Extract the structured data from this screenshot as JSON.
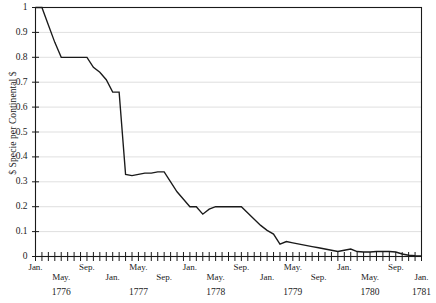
{
  "chart_data": {
    "type": "line",
    "title": "",
    "subtitle": "",
    "xlabel": "",
    "ylabel": "$ Specie per Continental $",
    "ylim": [
      0,
      1
    ],
    "xlim": [
      "Jan. 1776",
      "Jan. 1781"
    ],
    "grid": true,
    "legend": false,
    "series": [
      {
        "name": "$ Specie per Continental $",
        "color": "#1a1a1a",
        "x": [
          "Jan. 1776",
          "Feb. 1776",
          "Mar. 1776",
          "Apr. 1776",
          "May. 1776",
          "Jun. 1776",
          "Jul. 1776",
          "Aug. 1776",
          "Sep. 1776",
          "Oct. 1776",
          "Nov. 1776",
          "Dec. 1776",
          "Jan. 1777",
          "Feb. 1777",
          "Mar. 1777",
          "Apr. 1777",
          "May. 1777",
          "Jun. 1777",
          "Jul. 1777",
          "Aug. 1777",
          "Sep. 1777",
          "Oct. 1777",
          "Nov. 1777",
          "Dec. 1777",
          "Jan. 1778",
          "Feb. 1778",
          "Mar. 1778",
          "Apr. 1778",
          "May. 1778",
          "Jun. 1778",
          "Jul. 1778",
          "Aug. 1778",
          "Sep. 1778",
          "Oct. 1778",
          "Nov. 1778",
          "Dec. 1778",
          "Jan. 1779",
          "Feb. 1779",
          "Mar. 1779",
          "Apr. 1779",
          "May. 1779",
          "Jun. 1779",
          "Jul. 1779",
          "Aug. 1779",
          "Sep. 1779",
          "Oct. 1779",
          "Nov. 1779",
          "Dec. 1779",
          "Jan. 1780",
          "Feb. 1780",
          "Mar. 1780",
          "Apr. 1780",
          "May. 1780",
          "Jun. 1780",
          "Jul. 1780",
          "Aug. 1780",
          "Sep. 1780",
          "Oct. 1780",
          "Nov. 1780",
          "Dec. 1780",
          "Jan. 1781"
        ],
        "values": [
          1.0,
          1.0,
          0.93,
          0.86,
          0.8,
          0.8,
          0.8,
          0.8,
          0.8,
          0.76,
          0.74,
          0.71,
          0.66,
          0.66,
          0.33,
          0.325,
          0.33,
          0.335,
          0.335,
          0.34,
          0.34,
          0.3,
          0.26,
          0.23,
          0.2,
          0.2,
          0.17,
          0.19,
          0.2,
          0.2,
          0.2,
          0.2,
          0.2,
          0.175,
          0.15,
          0.125,
          0.105,
          0.09,
          0.05,
          0.06,
          0.055,
          0.05,
          0.045,
          0.04,
          0.035,
          0.03,
          0.025,
          0.02,
          0.025,
          0.03,
          0.02,
          0.018,
          0.018,
          0.02,
          0.02,
          0.02,
          0.018,
          0.01,
          0.005,
          0.003,
          0.002
        ]
      }
    ],
    "y_ticks": [
      "0",
      "0.1",
      "0.2",
      "0.3",
      "0.4",
      "0.5",
      "0.6",
      "0.7",
      "0.8",
      "0.9",
      "1"
    ],
    "y_tick_values": [
      0,
      0.1,
      0.2,
      0.3,
      0.4,
      0.5,
      0.6,
      0.7,
      0.8,
      0.9,
      1
    ],
    "x_tick_labels": [
      {
        "label": "Jan.",
        "month_index": 0,
        "row": 0
      },
      {
        "label": "May.",
        "month_index": 4,
        "row": 1
      },
      {
        "label": "Sep.",
        "month_index": 8,
        "row": 0
      },
      {
        "label": "Jan.",
        "month_index": 12,
        "row": 1
      },
      {
        "label": "May.",
        "month_index": 16,
        "row": 0
      },
      {
        "label": "Sep.",
        "month_index": 20,
        "row": 1
      },
      {
        "label": "Jan.",
        "month_index": 24,
        "row": 0
      },
      {
        "label": "May.",
        "month_index": 28,
        "row": 1
      },
      {
        "label": "Sep.",
        "month_index": 32,
        "row": 0
      },
      {
        "label": "Jan.",
        "month_index": 36,
        "row": 1
      },
      {
        "label": "May.",
        "month_index": 40,
        "row": 0
      },
      {
        "label": "Sep.",
        "month_index": 44,
        "row": 1
      },
      {
        "label": "Jan.",
        "month_index": 48,
        "row": 0
      },
      {
        "label": "May.",
        "month_index": 52,
        "row": 1
      },
      {
        "label": "Sep.",
        "month_index": 56,
        "row": 0
      },
      {
        "label": "Jan.",
        "month_index": 60,
        "row": 1
      }
    ],
    "x_year_labels": [
      {
        "label": "1776",
        "month_index": 4
      },
      {
        "label": "1777",
        "month_index": 16
      },
      {
        "label": "1778",
        "month_index": 28
      },
      {
        "label": "1779",
        "month_index": 40
      },
      {
        "label": "1780",
        "month_index": 52
      },
      {
        "label": "1781",
        "month_index": 60
      }
    ],
    "colors": {
      "line": "#1a1a1a",
      "grid": "#c9c9c9",
      "axis": "#1a1a1a",
      "background": "#ffffff",
      "text": "#1b1b1b"
    }
  }
}
